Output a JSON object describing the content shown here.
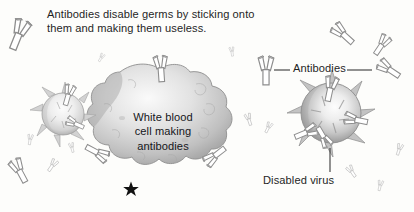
{
  "figure": {
    "background_color": "#fdfdfb",
    "text_color": "#1f1f1f",
    "caption_line_1": "Antibodies disable germs by sticking onto",
    "caption_line_2": "them and making them useless."
  },
  "labels": {
    "white_blood_cell_line_1": "White blood",
    "white_blood_cell_line_2": "cell making",
    "white_blood_cell_line_3": "antibodies",
    "antibodies": "Antibodies",
    "disabled_virus": "Disabled virus"
  },
  "elements": {
    "star_marker": "★",
    "white_blood_cell_icon": "amoeboid-cell",
    "virus_icon": "spiky-virus",
    "antibody_icon": "y-shaped-antibody"
  },
  "colors": {
    "cell_light": "#f2f2f2",
    "cell_mid": "#c9c9c9",
    "cell_dark": "#8d8d8d",
    "virus_light": "#f6f6f6",
    "virus_mid": "#bdbdbd",
    "virus_dark": "#7c7c7c",
    "antibody_stroke": "#8a8a8a",
    "antibody_fill": "#ffffff",
    "leader_line": "#3a3a3a",
    "star": "#111111"
  },
  "counts": {
    "viruses": 2,
    "white_blood_cells": 1,
    "free_antibodies": 14
  }
}
